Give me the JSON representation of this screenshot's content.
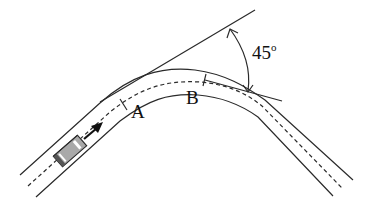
{
  "diagram": {
    "title": "",
    "labels": {
      "point_a": "A",
      "point_b": "B",
      "angle": "45",
      "angle_unit": "o"
    },
    "elements": [
      {
        "name": "road",
        "description": "curved road bending through 45 degrees"
      },
      {
        "name": "car",
        "description": "car moving up-right along road"
      },
      {
        "name": "direction-arrow",
        "description": "arrow showing car heading"
      },
      {
        "name": "tangent-lines",
        "description": "two tangent lines meeting at 45 degree angle"
      }
    ],
    "colors": {
      "line": "#2a2a2a",
      "car_fill": "#a9a9a9"
    }
  }
}
